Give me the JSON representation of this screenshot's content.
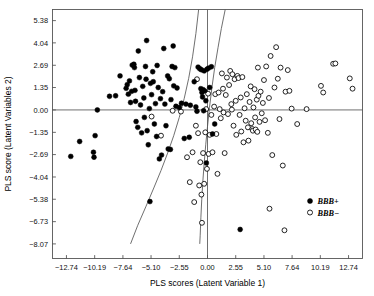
{
  "chart_data": {
    "type": "scatter",
    "title": "",
    "xlabel": "PLS scores (Latent Variable 1)",
    "ylabel": "PLS score (Latent Variables 2)",
    "xlim": [
      -14.0,
      14.0
    ],
    "ylim": [
      -8.95,
      6.05
    ],
    "grid": false,
    "xticks": [
      -12.74,
      -10.19,
      -7.64,
      -5.1,
      -2.55,
      0.0,
      2.55,
      5.1,
      7.64,
      10.19,
      12.74
    ],
    "xticklabels": [
      "−12.74",
      "−10.19",
      "−7.64",
      "−5.10",
      "−2.55",
      "0.00",
      "2.55",
      "5.10",
      "7.64",
      "10.19",
      "12.74"
    ],
    "yticks": [
      5.38,
      4.04,
      2.69,
      1.35,
      0.0,
      -1.35,
      -2.69,
      -4.04,
      -5.38,
      -6.73,
      -8.07
    ],
    "yticklabels": [
      "5.38",
      "4.04",
      "2.69",
      "1.35",
      "0.00",
      "−1.35",
      "−2.69",
      "−4.04",
      "−5.38",
      "−6.73",
      "−8.07"
    ],
    "legend_position": "lower-right",
    "reference_lines": [
      {
        "name": "x-zero-line",
        "orientation": "vertical",
        "value": 0.0
      },
      {
        "name": "y-zero-line",
        "orientation": "horizontal",
        "value": 0.0
      }
    ],
    "boundary_curves": [
      {
        "name": "left-decision-curve",
        "points": [
          [
            -0.8,
            6.05
          ],
          [
            -1.05,
            4.6
          ],
          [
            -1.35,
            3.2
          ],
          [
            -1.7,
            1.9
          ],
          [
            -2.1,
            0.7
          ],
          [
            -2.55,
            -0.45
          ],
          [
            -3.05,
            -1.55
          ],
          [
            -3.6,
            -2.6
          ],
          [
            -4.2,
            -3.65
          ],
          [
            -4.85,
            -4.7
          ],
          [
            -5.55,
            -5.8
          ],
          [
            -6.3,
            -6.95
          ],
          [
            -6.95,
            -8.07
          ]
        ]
      },
      {
        "name": "right-decision-curve",
        "points": [
          [
            1.6,
            6.05
          ],
          [
            1.25,
            4.9
          ],
          [
            0.95,
            3.75
          ],
          [
            0.65,
            2.55
          ],
          [
            0.4,
            1.35
          ],
          [
            0.18,
            0.15
          ],
          [
            0.0,
            -1.0
          ],
          [
            -0.16,
            -2.1
          ],
          [
            -0.3,
            -3.2
          ],
          [
            -0.42,
            -4.3
          ],
          [
            -0.52,
            -5.4
          ],
          [
            -0.6,
            -6.5
          ],
          [
            -0.66,
            -7.55
          ],
          [
            -0.7,
            -8.07
          ]
        ]
      }
    ],
    "series": [
      {
        "name": "BBB+",
        "label": "BBB+",
        "marker": "filled-circle",
        "color": "#000000",
        "count": 92,
        "points": [
          [
            -12.35,
            -2.8
          ],
          [
            -11.55,
            -1.9
          ],
          [
            -10.3,
            -2.55
          ],
          [
            -10.25,
            -2.85
          ],
          [
            -10.15,
            -1.55
          ],
          [
            -9.95,
            0.0
          ],
          [
            -8.85,
            0.82
          ],
          [
            -8.3,
            0.85
          ],
          [
            -7.9,
            2.05
          ],
          [
            -7.35,
            1.3
          ],
          [
            -7.25,
            1.52
          ],
          [
            -7.15,
            0.95
          ],
          [
            -7.05,
            1.75
          ],
          [
            -6.95,
            0.45
          ],
          [
            -6.85,
            1.12
          ],
          [
            -6.8,
            2.7
          ],
          [
            -6.65,
            2.75
          ],
          [
            -6.6,
            2.55
          ],
          [
            -6.55,
            1.18
          ],
          [
            -6.5,
            0.52
          ],
          [
            -6.45,
            -0.7
          ],
          [
            -6.3,
            -1.05
          ],
          [
            -6.25,
            3.55
          ],
          [
            -6.15,
            1.95
          ],
          [
            -6.05,
            0.3
          ],
          [
            -5.95,
            -1.38
          ],
          [
            -5.85,
            1.42
          ],
          [
            -5.75,
            0.72
          ],
          [
            -5.7,
            -0.45
          ],
          [
            -5.6,
            2.62
          ],
          [
            -5.55,
            1.85
          ],
          [
            -5.5,
            4.18
          ],
          [
            -5.45,
            -1.25
          ],
          [
            -5.35,
            -2.1
          ],
          [
            -5.25,
            0.08
          ],
          [
            -5.2,
            -5.52
          ],
          [
            -5.15,
            1.6
          ],
          [
            -5.05,
            0.92
          ],
          [
            -4.95,
            2.3
          ],
          [
            -4.9,
            1.7
          ],
          [
            -4.8,
            -0.85
          ],
          [
            -4.7,
            0.38
          ],
          [
            -4.6,
            -1.6
          ],
          [
            -4.55,
            2.68
          ],
          [
            -4.45,
            1.35
          ],
          [
            -4.35,
            -2.95
          ],
          [
            -4.25,
            0.68
          ],
          [
            -4.15,
            -2.72
          ],
          [
            -4.05,
            1.1
          ],
          [
            -3.95,
            3.7
          ],
          [
            -3.85,
            0.35
          ],
          [
            -3.75,
            -0.95
          ],
          [
            -3.6,
            2.05
          ],
          [
            -3.55,
            -2.35
          ],
          [
            -3.45,
            1.88
          ],
          [
            -3.35,
            -2.38
          ],
          [
            -3.3,
            0.62
          ],
          [
            -3.2,
            2.62
          ],
          [
            -3.1,
            3.85
          ],
          [
            -3.05,
            1.45
          ],
          [
            -2.95,
            2.55
          ],
          [
            -2.85,
            0.22
          ],
          [
            -2.75,
            1.32
          ],
          [
            -2.55,
            0.15
          ],
          [
            -2.35,
            0.4
          ],
          [
            -2.1,
            -1.72
          ],
          [
            -1.95,
            0.35
          ],
          [
            -1.65,
            -1.65
          ],
          [
            -1.55,
            0.28
          ],
          [
            -1.2,
            1.7
          ],
          [
            -1.05,
            0.18
          ],
          [
            -0.95,
            -0.08
          ],
          [
            -0.85,
            2.58
          ],
          [
            -0.7,
            2.48
          ],
          [
            -0.6,
            1.28
          ],
          [
            -0.55,
            2.42
          ],
          [
            -0.5,
            1.05
          ],
          [
            -0.45,
            0.78
          ],
          [
            -0.4,
            1.22
          ],
          [
            -0.35,
            -0.05
          ],
          [
            -0.3,
            2.35
          ],
          [
            -0.25,
            1.15
          ],
          [
            -0.15,
            0.55
          ],
          [
            -0.1,
            -3.2
          ],
          [
            -0.05,
            2.45
          ],
          [
            0.1,
            2.52
          ],
          [
            0.2,
            1.35
          ],
          [
            0.35,
            2.6
          ],
          [
            0.45,
            -1.45
          ],
          [
            0.65,
            -0.85
          ],
          [
            2.95,
            -7.2
          ]
        ]
      },
      {
        "name": "BBB-",
        "label": "BBB−",
        "marker": "open-circle",
        "color": "#000000",
        "count": 104,
        "points": [
          [
            -5.05,
            -0.4
          ],
          [
            -4.2,
            -1.55
          ],
          [
            -3.15,
            -0.05
          ],
          [
            -2.4,
            -0.1
          ],
          [
            -1.85,
            -2.85
          ],
          [
            -1.6,
            -4.35
          ],
          [
            -1.35,
            -2.55
          ],
          [
            -1.2,
            -5.55
          ],
          [
            -1.05,
            -0.95
          ],
          [
            -0.95,
            1.85
          ],
          [
            -0.85,
            -1.4
          ],
          [
            -0.75,
            -4.55
          ],
          [
            -0.65,
            -3.15
          ],
          [
            -0.55,
            -5.1
          ],
          [
            -0.5,
            -6.8
          ],
          [
            -0.4,
            -2.6
          ],
          [
            -0.3,
            -4.45
          ],
          [
            -0.2,
            -1.35
          ],
          [
            -0.12,
            0.05
          ],
          [
            -0.05,
            -3.55
          ],
          [
            0.1,
            -2.65
          ],
          [
            0.2,
            -1.5
          ],
          [
            0.35,
            -0.3
          ],
          [
            0.45,
            -2.55
          ],
          [
            0.6,
            0.2
          ],
          [
            0.7,
            0.95
          ],
          [
            0.8,
            -1.45
          ],
          [
            0.9,
            -3.85
          ],
          [
            1.0,
            1.05
          ],
          [
            1.1,
            0.05
          ],
          [
            1.2,
            -0.5
          ],
          [
            1.3,
            2.2
          ],
          [
            1.4,
            1.28
          ],
          [
            1.45,
            -0.15
          ],
          [
            1.55,
            -2.6
          ],
          [
            1.65,
            0.9
          ],
          [
            1.75,
            1.95
          ],
          [
            1.85,
            -0.25
          ],
          [
            1.95,
            1.5
          ],
          [
            2.05,
            2.35
          ],
          [
            2.15,
            0.35
          ],
          [
            2.25,
            2.15
          ],
          [
            2.35,
            -0.95
          ],
          [
            2.45,
            1.85
          ],
          [
            2.55,
            0.55
          ],
          [
            2.6,
            -1.5
          ],
          [
            2.7,
            2.05
          ],
          [
            2.8,
            1.92
          ],
          [
            2.9,
            -0.3
          ],
          [
            3.0,
            0.75
          ],
          [
            3.05,
            -1.3
          ],
          [
            3.15,
            1.98
          ],
          [
            3.25,
            -1.95
          ],
          [
            3.35,
            0.1
          ],
          [
            3.45,
            -0.65
          ],
          [
            3.55,
            0.95
          ],
          [
            3.65,
            -1.05
          ],
          [
            3.7,
            -1.85
          ],
          [
            3.8,
            0.48
          ],
          [
            3.9,
            1.42
          ],
          [
            3.95,
            -0.8
          ],
          [
            4.05,
            -1.15
          ],
          [
            4.1,
            -1.25
          ],
          [
            4.15,
            0.15
          ],
          [
            4.25,
            1.25
          ],
          [
            4.3,
            -0.45
          ],
          [
            4.35,
            -1.18
          ],
          [
            4.45,
            0.62
          ],
          [
            4.5,
            -1.32
          ],
          [
            4.55,
            2.55
          ],
          [
            4.6,
            0.85
          ],
          [
            4.7,
            -0.72
          ],
          [
            4.8,
            1.1
          ],
          [
            4.9,
            -0.2
          ],
          [
            5.0,
            0.42
          ],
          [
            5.1,
            1.8
          ],
          [
            5.2,
            -0.62
          ],
          [
            5.3,
            2.62
          ],
          [
            5.45,
            -1.38
          ],
          [
            5.55,
            0.72
          ],
          [
            5.6,
            -5.95
          ],
          [
            5.7,
            3.25
          ],
          [
            5.85,
            -2.72
          ],
          [
            6.05,
            1.35
          ],
          [
            6.2,
            3.78
          ],
          [
            6.35,
            1.88
          ],
          [
            6.5,
            -0.55
          ],
          [
            6.6,
            2.55
          ],
          [
            6.8,
            -3.35
          ],
          [
            6.95,
            -7.25
          ],
          [
            7.05,
            1.1
          ],
          [
            7.25,
            2.4
          ],
          [
            7.4,
            1.15
          ],
          [
            7.6,
            0.08
          ],
          [
            8.1,
            -0.85
          ],
          [
            8.95,
            0.05
          ],
          [
            10.25,
            1.45
          ],
          [
            10.45,
            1.05
          ],
          [
            11.35,
            2.78
          ],
          [
            11.55,
            2.8
          ],
          [
            12.85,
            1.9
          ],
          [
            13.1,
            1.28
          ],
          [
            2.2,
            0.02
          ],
          [
            0.05,
            0.98
          ]
        ]
      }
    ]
  },
  "legend": {
    "entries": [
      {
        "label": "BBB+",
        "marker": "filled-circle"
      },
      {
        "label": "BBB−",
        "marker": "open-circle"
      }
    ]
  }
}
